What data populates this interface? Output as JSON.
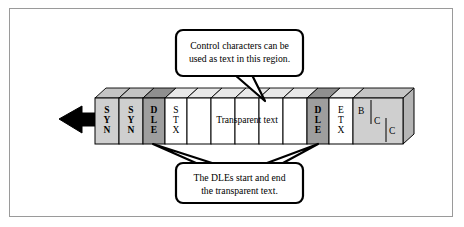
{
  "figure": {
    "background_color": "#ffffff",
    "frame_border_color": "#9a9a9a"
  },
  "colors": {
    "cell_light_gray": "#cfcfcf",
    "cell_dark_gray": "#9e9e9e",
    "cell_white": "#ffffff",
    "top_face_light": "#c4c4c4",
    "top_face_dark": "#8f8f8f",
    "top_face_white": "#e8e8e8",
    "side_face": "#b5b5b5",
    "outline": "#000000",
    "arrow_fill": "#000000",
    "callout_fill": "#ffffff",
    "callout_stroke": "#000000"
  },
  "direction_arrow": {
    "name": "transmission-direction-arrow",
    "points_to": "left"
  },
  "frame_cells": [
    {
      "id": "syn-1",
      "label_lines": [
        "S",
        "Y",
        "N"
      ],
      "bold": true,
      "fill": "light-gray"
    },
    {
      "id": "syn-2",
      "label_lines": [
        "S",
        "Y",
        "N"
      ],
      "bold": true,
      "fill": "light-gray"
    },
    {
      "id": "dle-1",
      "label_lines": [
        "D",
        "L",
        "E"
      ],
      "bold": true,
      "fill": "dark-gray"
    },
    {
      "id": "stx",
      "label_lines": [
        "S",
        "T",
        "X"
      ],
      "bold": false,
      "fill": "white"
    },
    {
      "id": "data-1",
      "label_lines": [],
      "bold": false,
      "fill": "white"
    },
    {
      "id": "data-2",
      "label_lines": [],
      "bold": false,
      "fill": "white"
    },
    {
      "id": "data-3",
      "label_lines": [],
      "bold": false,
      "fill": "white"
    },
    {
      "id": "data-4",
      "label_lines": [],
      "bold": false,
      "fill": "white"
    },
    {
      "id": "data-5",
      "label_lines": [],
      "bold": false,
      "fill": "white"
    },
    {
      "id": "dle-2",
      "label_lines": [
        "D",
        "L",
        "E"
      ],
      "bold": true,
      "fill": "dark-gray"
    },
    {
      "id": "etx",
      "label_lines": [
        "E",
        "T",
        "X"
      ],
      "bold": false,
      "fill": "white"
    },
    {
      "id": "bcc",
      "label_lines": [
        "B",
        "C",
        "C"
      ],
      "bold": false,
      "fill": "light-gray"
    }
  ],
  "transparent_region": {
    "label": "Transparent text"
  },
  "bcc_block": {
    "letters": [
      "B",
      "C",
      "C"
    ]
  },
  "callouts": [
    {
      "id": "top-callout",
      "name": "control-characters-callout",
      "lines": [
        "Control characters can be",
        "used as text in this region."
      ]
    },
    {
      "id": "bottom-callout",
      "name": "dle-delimiters-callout",
      "lines": [
        "The DLEs start and end",
        "the transparent text."
      ]
    }
  ]
}
